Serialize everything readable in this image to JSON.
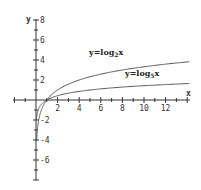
{
  "chart_data": {
    "type": "line",
    "title": "",
    "xlabel": "x",
    "ylabel": "y",
    "xlim": [
      -2,
      14.3
    ],
    "ylim": [
      -8,
      8
    ],
    "grid": false,
    "x_ticks": [
      2,
      4,
      6,
      8,
      10,
      12
    ],
    "y_ticks": [
      8,
      6,
      4,
      2,
      -2,
      -4,
      -6
    ],
    "series": [
      {
        "name": "y=log2x",
        "label_main": "y=log",
        "label_sub": "2",
        "label_tail": "x",
        "base": 2,
        "x": [
          0.06,
          0.25,
          0.5,
          1,
          2,
          4,
          6,
          8,
          10,
          12,
          14
        ],
        "values": [
          -4.06,
          -2,
          -1,
          0,
          1,
          2,
          2.58,
          3,
          3.32,
          3.58,
          3.81
        ]
      },
      {
        "name": "y=log5x",
        "label_main": "y=log",
        "label_sub": "5",
        "label_tail": "x",
        "base": 5,
        "x": [
          0.04,
          0.2,
          0.5,
          1,
          2,
          4,
          6,
          8,
          10,
          12,
          14
        ],
        "values": [
          -2,
          -1,
          -0.43,
          0,
          0.43,
          0.86,
          1.11,
          1.29,
          1.43,
          1.54,
          1.64
        ]
      }
    ],
    "colors": {
      "axis": "#333333",
      "curve": "#555555",
      "background": "#ffffff"
    }
  }
}
